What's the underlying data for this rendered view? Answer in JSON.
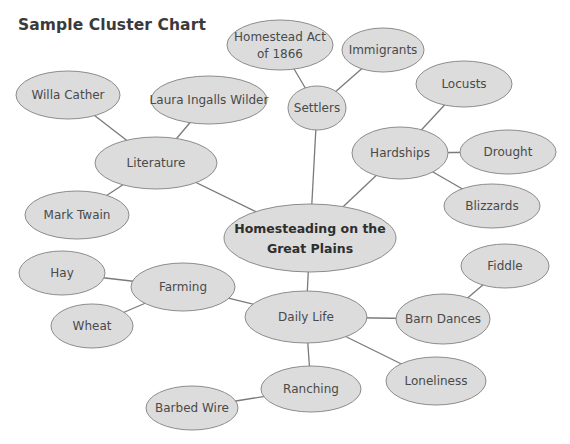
{
  "page": {
    "title": "Sample Cluster Chart"
  },
  "diagram": {
    "colors": {
      "fill": "#dcdcdc",
      "stroke": "#8c8c8c",
      "edge": "#7a7a7a",
      "text": "#4a4a4a"
    },
    "nodes": [
      {
        "id": "center",
        "lines": [
          "Homesteading on the",
          "Great Plains"
        ],
        "cx": 310,
        "cy": 238,
        "rx": 86,
        "ry": 34,
        "central": true
      },
      {
        "id": "settlers",
        "lines": [
          "Settlers"
        ],
        "cx": 317,
        "cy": 108,
        "rx": 29,
        "ry": 22
      },
      {
        "id": "homestead-act",
        "lines": [
          "Homestead Act",
          "of 1866"
        ],
        "cx": 280,
        "cy": 45,
        "rx": 53,
        "ry": 25
      },
      {
        "id": "immigrants",
        "lines": [
          "Immigrants"
        ],
        "cx": 383,
        "cy": 50,
        "rx": 41,
        "ry": 22
      },
      {
        "id": "literature",
        "lines": [
          "Literature"
        ],
        "cx": 156,
        "cy": 163,
        "rx": 61,
        "ry": 26
      },
      {
        "id": "willa-cather",
        "lines": [
          "Willa Cather"
        ],
        "cx": 68,
        "cy": 95,
        "rx": 52,
        "ry": 24
      },
      {
        "id": "laura-ingalls-wilder",
        "lines": [
          "Laura Ingalls Wilder"
        ],
        "cx": 209,
        "cy": 100,
        "rx": 58,
        "ry": 24
      },
      {
        "id": "mark-twain",
        "lines": [
          "Mark Twain"
        ],
        "cx": 77,
        "cy": 215,
        "rx": 52,
        "ry": 24
      },
      {
        "id": "hardships",
        "lines": [
          "Hardships"
        ],
        "cx": 400,
        "cy": 153,
        "rx": 48,
        "ry": 26
      },
      {
        "id": "locusts",
        "lines": [
          "Locusts"
        ],
        "cx": 464,
        "cy": 84,
        "rx": 48,
        "ry": 23
      },
      {
        "id": "drought",
        "lines": [
          "Drought"
        ],
        "cx": 508,
        "cy": 152,
        "rx": 48,
        "ry": 22
      },
      {
        "id": "blizzards",
        "lines": [
          "Blizzards"
        ],
        "cx": 492,
        "cy": 206,
        "rx": 48,
        "ry": 22
      },
      {
        "id": "daily-life",
        "lines": [
          "Daily Life"
        ],
        "cx": 306,
        "cy": 317,
        "rx": 61,
        "ry": 26
      },
      {
        "id": "farming",
        "lines": [
          "Farming"
        ],
        "cx": 183,
        "cy": 287,
        "rx": 52,
        "ry": 24
      },
      {
        "id": "hay",
        "lines": [
          "Hay"
        ],
        "cx": 62,
        "cy": 273,
        "rx": 43,
        "ry": 22
      },
      {
        "id": "wheat",
        "lines": [
          "Wheat"
        ],
        "cx": 92,
        "cy": 326,
        "rx": 41,
        "ry": 22
      },
      {
        "id": "barn-dances",
        "lines": [
          "Barn Dances"
        ],
        "cx": 443,
        "cy": 319,
        "rx": 47,
        "ry": 25
      },
      {
        "id": "fiddle",
        "lines": [
          "Fiddle"
        ],
        "cx": 505,
        "cy": 266,
        "rx": 44,
        "ry": 22
      },
      {
        "id": "loneliness",
        "lines": [
          "Loneliness"
        ],
        "cx": 436,
        "cy": 381,
        "rx": 50,
        "ry": 24
      },
      {
        "id": "ranching",
        "lines": [
          "Ranching"
        ],
        "cx": 311,
        "cy": 389,
        "rx": 50,
        "ry": 23
      },
      {
        "id": "barbed-wire",
        "lines": [
          "Barbed Wire"
        ],
        "cx": 192,
        "cy": 408,
        "rx": 46,
        "ry": 22
      }
    ],
    "edges": [
      [
        "center",
        "settlers"
      ],
      [
        "settlers",
        "homestead-act"
      ],
      [
        "settlers",
        "immigrants"
      ],
      [
        "center",
        "literature"
      ],
      [
        "literature",
        "willa-cather"
      ],
      [
        "literature",
        "laura-ingalls-wilder"
      ],
      [
        "literature",
        "mark-twain"
      ],
      [
        "center",
        "hardships"
      ],
      [
        "hardships",
        "locusts"
      ],
      [
        "hardships",
        "drought"
      ],
      [
        "hardships",
        "blizzards"
      ],
      [
        "center",
        "daily-life"
      ],
      [
        "daily-life",
        "farming"
      ],
      [
        "farming",
        "hay"
      ],
      [
        "farming",
        "wheat"
      ],
      [
        "daily-life",
        "barn-dances"
      ],
      [
        "barn-dances",
        "fiddle"
      ],
      [
        "daily-life",
        "loneliness"
      ],
      [
        "daily-life",
        "ranching"
      ],
      [
        "ranching",
        "barbed-wire"
      ]
    ]
  }
}
